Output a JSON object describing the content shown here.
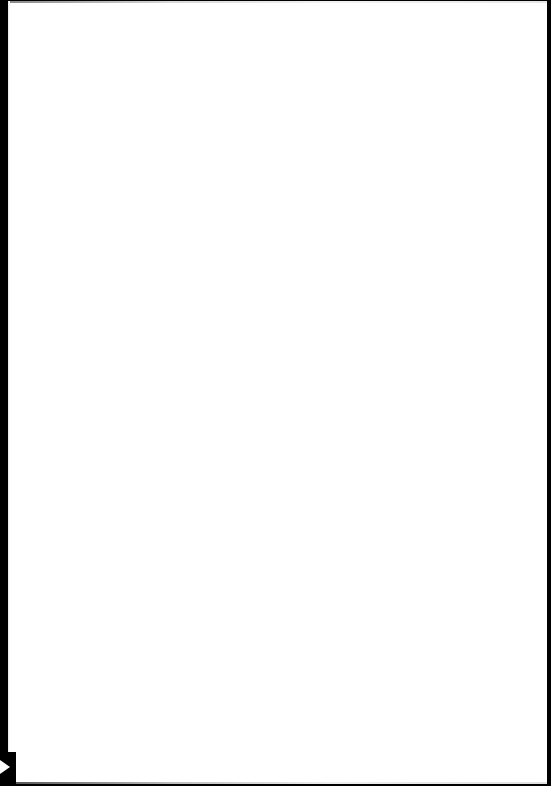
{
  "document": {
    "type": "scanned-page",
    "content": "",
    "colors": {
      "page": "#ffffff",
      "border": "#000000"
    }
  }
}
